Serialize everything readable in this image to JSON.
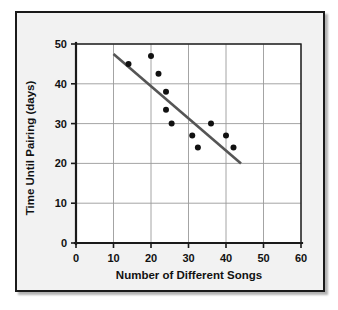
{
  "figure": {
    "frame_color": "#1a1a1a",
    "background_color": "#f2f2f2",
    "plot_background_color": "#ffffff"
  },
  "chart_data": {
    "type": "scatter",
    "title": "",
    "subtitle": "",
    "xlabel": "Number of Different Songs",
    "ylabel": "Time Until Pairing (days)",
    "xlim": [
      0,
      60
    ],
    "ylim": [
      0,
      50
    ],
    "xticks": [
      0,
      10,
      20,
      30,
      40,
      50,
      60
    ],
    "yticks": [
      0,
      10,
      20,
      30,
      40,
      50
    ],
    "xtick_labels": [
      "0",
      "10",
      "20",
      "30",
      "40",
      "50",
      "60"
    ],
    "ytick_labels": [
      "0",
      "10",
      "20",
      "30",
      "40",
      "50"
    ],
    "grid": true,
    "grid_color": "#9a9a9a",
    "legend": false,
    "legend_position": "none",
    "annotations": [],
    "point_color": "#111111",
    "point_radius": 3,
    "points": [
      {
        "x": 14,
        "y": 45
      },
      {
        "x": 20,
        "y": 47
      },
      {
        "x": 22,
        "y": 42.5
      },
      {
        "x": 24,
        "y": 38
      },
      {
        "x": 24,
        "y": 33.5
      },
      {
        "x": 25.5,
        "y": 30
      },
      {
        "x": 31,
        "y": 27
      },
      {
        "x": 32.5,
        "y": 24
      },
      {
        "x": 36,
        "y": 30
      },
      {
        "x": 40,
        "y": 27
      },
      {
        "x": 42,
        "y": 24
      }
    ],
    "trend_line": {
      "label": "line of best fit",
      "color": "#555555",
      "x_start": 10,
      "y_start": 47.5,
      "x_end": 44,
      "y_end": 20
    }
  }
}
